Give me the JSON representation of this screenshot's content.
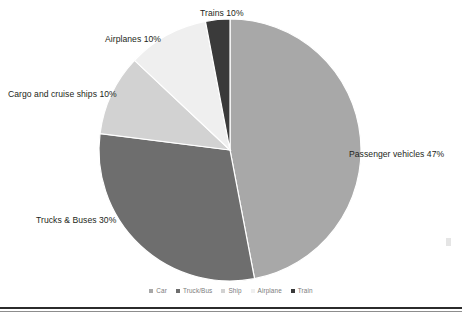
{
  "chart_data": {
    "type": "pie",
    "title": "",
    "categories": [
      "Car",
      "Truck/Bus",
      "Ship",
      "Airplane",
      "Train"
    ],
    "values": [
      47,
      30,
      10,
      10,
      10
    ],
    "unit": "%",
    "start_angle_deg": 0,
    "direction": "clockwise",
    "legend_position": "bottom",
    "grid": false,
    "slices": [
      {
        "key": "car",
        "legend_label": "Car",
        "callout": "Passenger vehicles 47%",
        "value": 47,
        "color": "#a8a8a8",
        "start_deg": 0,
        "end_deg": 169.2
      },
      {
        "key": "truck_bus",
        "legend_label": "Truck/Bus",
        "callout": "Trucks & Buses 30%",
        "value": 30,
        "color": "#6e6e6e",
        "start_deg": 169.2,
        "end_deg": 277.2
      },
      {
        "key": "ship",
        "legend_label": "Ship",
        "callout": "Cargo and cruise ships 10%",
        "value": 10,
        "color": "#d2d2d2",
        "start_deg": 277.2,
        "end_deg": 313.2
      },
      {
        "key": "airplane",
        "legend_label": "Airplane",
        "callout": "Airplanes 10%",
        "value": 10,
        "color": "#efefef",
        "start_deg": 313.2,
        "end_deg": 349.2
      },
      {
        "key": "train",
        "legend_label": "Train",
        "callout": "Trains 10%",
        "value": 10,
        "color": "#3a3a3a",
        "start_deg": 349.2,
        "end_deg": 360
      }
    ]
  },
  "callouts": {
    "train": "Trains 10%",
    "airplane": "Airplanes 10%",
    "ship": "Cargo and cruise ships 10%",
    "truck_bus": "Trucks & Buses 30%",
    "car": "Passenger vehicles 47%"
  },
  "legend": {
    "items": [
      {
        "label": "Car",
        "color": "#a8a8a8"
      },
      {
        "label": "Truck/Bus",
        "color": "#6e6e6e"
      },
      {
        "label": "Ship",
        "color": "#d2d2d2"
      },
      {
        "label": "Airplane",
        "color": "#efefef"
      },
      {
        "label": "Train",
        "color": "#3a3a3a"
      }
    ]
  },
  "colors": {
    "background": "#ffffff",
    "text": "#231f20",
    "legend_text": "#7b7b7b",
    "rule": "#2b2b2b"
  }
}
